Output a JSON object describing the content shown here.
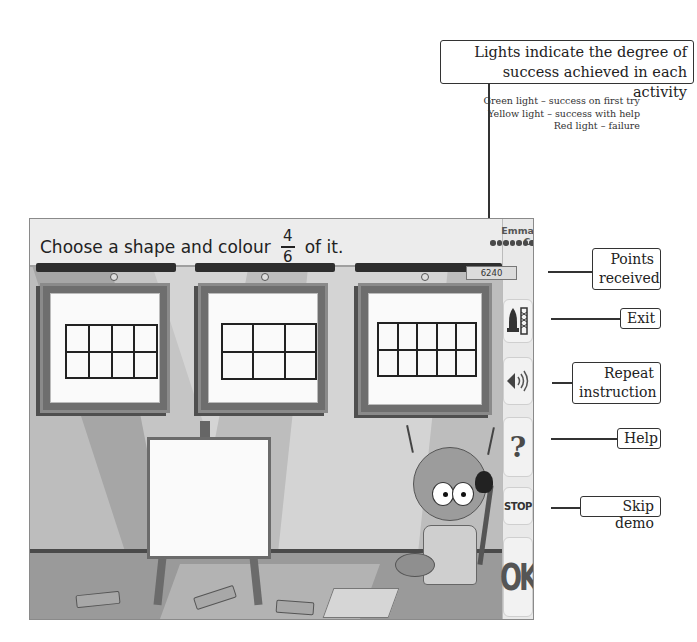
{
  "annotations": {
    "lights": {
      "title_line1": "Lights indicate the degree of",
      "title_line2": "success achieved in each activity",
      "legend": [
        "Green light – success on first try",
        "Yellow light – success with help",
        "Red light – failure"
      ]
    },
    "points_line1": "Points",
    "points_line2": "received",
    "exit": "Exit",
    "repeat_line1": "Repeat",
    "repeat_line2": "instruction",
    "help": "Help",
    "skip_demo": "Skip demo"
  },
  "game": {
    "instruction_before": "Choose a shape and colour",
    "fraction_numerator": "4",
    "fraction_denominator": "6",
    "instruction_after": "of it.",
    "player_name": "Emma C.",
    "lights_count": 8,
    "score": "6240",
    "shapes": [
      {
        "rows": 2,
        "cols": 4
      },
      {
        "rows": 2,
        "cols": 3
      },
      {
        "rows": 2,
        "cols": 5
      }
    ],
    "buttons": {
      "exit_icon": "rocket-icon",
      "repeat_icon": "speaker-icon",
      "help_icon": "question-mark-icon",
      "stop_label": "STOP",
      "ok_label": "OK"
    }
  }
}
